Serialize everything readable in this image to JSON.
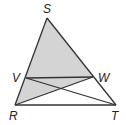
{
  "diagram": {
    "points": {
      "S": {
        "label": "S",
        "x": 47,
        "y": 18,
        "lx": 43,
        "ly": 13
      },
      "V": {
        "label": "V",
        "x": 26,
        "y": 78,
        "lx": 12,
        "ly": 82
      },
      "W": {
        "label": "W",
        "x": 93,
        "y": 77,
        "lx": 98,
        "ly": 82
      },
      "R": {
        "label": "R",
        "x": 15,
        "y": 105,
        "lx": 9,
        "ly": 120
      },
      "T": {
        "label": "T",
        "x": 116,
        "y": 105,
        "lx": 111,
        "ly": 120
      }
    },
    "segments": [
      "SR",
      "ST",
      "RT",
      "VW",
      "VT",
      "RW"
    ],
    "shaded_region": "triangle SRW",
    "colors": {
      "shade": "#d4d4d4",
      "stroke": "#333333"
    }
  }
}
